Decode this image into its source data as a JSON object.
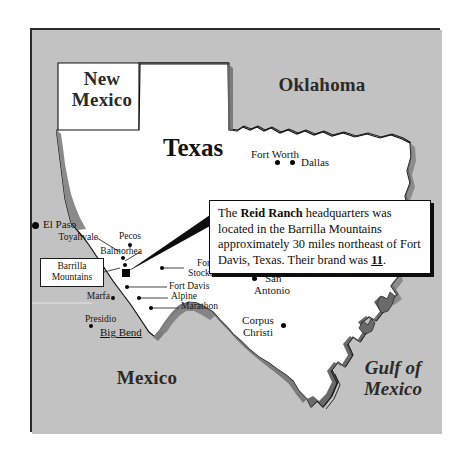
{
  "map": {
    "title_region": "Texas",
    "frame": {
      "border_color": "#2b2b2b",
      "land_fill": "#ffffff",
      "outside_fill": "#c2c2c2"
    },
    "regions": [
      {
        "name": "New Mexico",
        "lines": [
          "New",
          "Mexico"
        ]
      },
      {
        "name": "Oklahoma",
        "lines": [
          "Oklahoma"
        ]
      },
      {
        "name": "Texas",
        "lines": [
          "Texas"
        ]
      },
      {
        "name": "Mexico",
        "lines": [
          "Mexico"
        ]
      },
      {
        "name": "Gulf of Mexico",
        "lines": [
          "Gulf of",
          "Mexico"
        ]
      }
    ],
    "cities": [
      {
        "name": "El Paso"
      },
      {
        "name": "Pecos"
      },
      {
        "name": "Toyahvale"
      },
      {
        "name": "Balmorhea"
      },
      {
        "name": "Fort Stockton",
        "lines": [
          "Fort",
          "Stockton"
        ]
      },
      {
        "name": "Fort Davis"
      },
      {
        "name": "Marfa"
      },
      {
        "name": "Alpine"
      },
      {
        "name": "Marathon"
      },
      {
        "name": "Presidio"
      },
      {
        "name": "Big Bend"
      },
      {
        "name": "Fort Worth"
      },
      {
        "name": "Dallas"
      },
      {
        "name": "San Antonio",
        "lines": [
          "San",
          "Antonio"
        ]
      },
      {
        "name": "Houston"
      },
      {
        "name": "Corpus Christi",
        "lines": [
          "Corpus",
          "Christi"
        ]
      }
    ],
    "barrilla_label": {
      "line1": "Barrilla",
      "line2": "Mountains"
    },
    "callout": {
      "text_part1": "The ",
      "ranch_name": "Reid Ranch",
      "text_part2": " headquarters was located in the Barrilla Mountains approximately 30 miles northeast of Fort Davis, Texas. Their brand was ",
      "brand": "11",
      "text_part3": "."
    }
  }
}
